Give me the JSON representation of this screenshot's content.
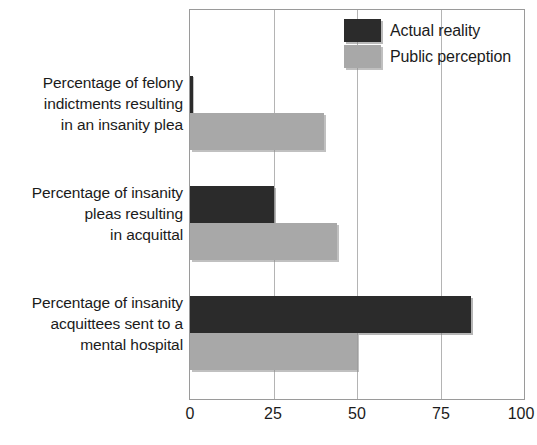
{
  "chart_data": {
    "type": "bar",
    "orientation": "horizontal",
    "title": "",
    "xlabel": "",
    "ylabel": "",
    "xlim": [
      0,
      100
    ],
    "xticks": [
      "0",
      "25",
      "50",
      "75",
      "100"
    ],
    "grid": "vertical",
    "legend_position": "top-right",
    "categories": [
      "Percentage of felony indictments resulting in an insanity plea",
      "Percentage of insanity pleas resulting in acquittal",
      "Percentage of insanity acquittees sent to a mental hospital"
    ],
    "category_lines": [
      [
        "Percentage of felony",
        "indictments resulting",
        "in an insanity plea"
      ],
      [
        "Percentage of insanity",
        "pleas resulting",
        "in acquittal"
      ],
      [
        "Percentage of insanity",
        "acquittees sent to a",
        "mental hospital"
      ]
    ],
    "series": [
      {
        "name": "Actual reality",
        "color": "#2b2b2b",
        "values": [
          1,
          25,
          84
        ]
      },
      {
        "name": "Public perception",
        "color": "#a8a8a8",
        "values": [
          40,
          44,
          50
        ]
      }
    ]
  },
  "legend": {
    "items": [
      {
        "label": "Actual reality",
        "swatch": "dark-swatch"
      },
      {
        "label": "Public perception",
        "swatch": "light-swatch"
      }
    ]
  },
  "axis": {
    "ticks": [
      {
        "value": 0,
        "label": "0"
      },
      {
        "value": 25,
        "label": "25"
      },
      {
        "value": 50,
        "label": "50"
      },
      {
        "value": 75,
        "label": "75"
      },
      {
        "value": 100,
        "label": "100"
      }
    ]
  },
  "colors": {
    "actual_reality": "#2b2b2b",
    "public_perception": "#a8a8a8",
    "frame": "#9a9a9a",
    "gridline": "#b4b4b4",
    "text": "#1b1b1b",
    "background": "#ffffff"
  }
}
